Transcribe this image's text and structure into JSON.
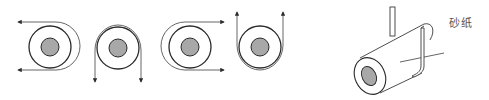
{
  "diagram": {
    "label_sandpaper": "砂纸",
    "colors": {
      "line": "#2a2a2a",
      "paper_line": "#555555",
      "core_fill": "#a8a8a8",
      "background": "#ffffff"
    },
    "rollers_2d": [
      {
        "id": "roller-1",
        "center": [
          50,
          47
        ],
        "wrap": "right side, both ends pointing left",
        "arrows": [
          "left",
          "left"
        ]
      },
      {
        "id": "roller-2",
        "center": [
          117,
          49
        ],
        "wrap": "top side, both ends pointing down",
        "arrows": [
          "down",
          "down"
        ]
      },
      {
        "id": "roller-3",
        "center": [
          190,
          47
        ],
        "wrap": "left side, both ends pointing right",
        "arrows": [
          "right",
          "right"
        ]
      },
      {
        "id": "roller-4",
        "center": [
          260,
          49
        ],
        "wrap": "bottom side, both ends pointing up",
        "arrows": [
          "up",
          "up"
        ]
      }
    ],
    "roller_3d": {
      "id": "cylinder-with-sandpaper",
      "annotation": "砂纸"
    }
  }
}
